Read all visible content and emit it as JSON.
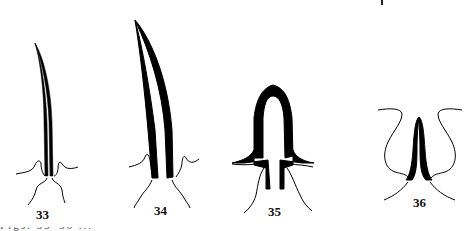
{
  "figure": {
    "panels": [
      {
        "id": "33",
        "label": "33",
        "description": "long slender curved spine with narrow central slit and flared basal membrane"
      },
      {
        "id": "34",
        "label": "34",
        "description": "longer, broader curved spine with central slit and flared basal membrane"
      },
      {
        "id": "35",
        "label": "35",
        "description": "short stout arched spine with broad wings at base"
      },
      {
        "id": "36",
        "label": "36",
        "description": "small arched spine within rounded lateral membranes"
      }
    ],
    "caption_clipped": "Figs. 33–36 ..."
  }
}
